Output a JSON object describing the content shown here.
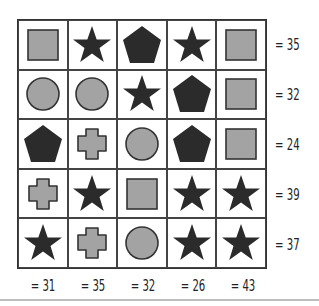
{
  "puzzle": {
    "type": "shape-sum-grid",
    "colors": {
      "dark": "#2b2b2b",
      "gray": "#a3a3a3",
      "stroke": "#333333",
      "grid": "#444444"
    },
    "grid": [
      [
        "square",
        "star",
        "pentagon",
        "star",
        "square"
      ],
      [
        "circle",
        "circle",
        "star",
        "pentagon",
        "square"
      ],
      [
        "pentagon",
        "cross",
        "circle",
        "pentagon",
        "square"
      ],
      [
        "cross",
        "star",
        "square",
        "star",
        "star"
      ],
      [
        "star",
        "cross",
        "circle",
        "star",
        "star"
      ]
    ],
    "row_sums": [
      "= 35",
      "= 32",
      "= 24",
      "= 39",
      "= 37"
    ],
    "col_sums": [
      "= 31",
      "= 35",
      "= 32",
      "= 26",
      "= 43"
    ]
  }
}
